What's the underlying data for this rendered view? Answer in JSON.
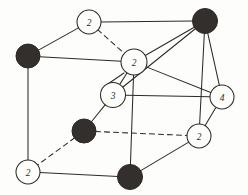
{
  "figure": {
    "width": 248,
    "height": 195,
    "background_color": "#fdfdfb",
    "line_color": "#2b2b28",
    "filled_atom_color": "#332f2d",
    "open_atom_fill": "#fdfdfb"
  },
  "atoms": [
    {
      "id": "a1",
      "label": "2",
      "type": "open",
      "cx": 89,
      "cy": 22,
      "r": 12,
      "name": "atom-top-back-left-2"
    },
    {
      "id": "a2",
      "label": "",
      "type": "filled",
      "cx": 205,
      "cy": 21,
      "r": 12.5,
      "name": "atom-top-back-right-filled"
    },
    {
      "id": "a3",
      "label": "",
      "type": "filled",
      "cx": 28,
      "cy": 56,
      "r": 12,
      "name": "atom-top-front-left-filled"
    },
    {
      "id": "a4",
      "label": "2",
      "type": "open",
      "cx": 134,
      "cy": 62,
      "r": 13,
      "name": "atom-center-2"
    },
    {
      "id": "a5",
      "label": "3",
      "type": "open",
      "cx": 113,
      "cy": 95,
      "r": 12.5,
      "name": "atom-center-lower-3"
    },
    {
      "id": "a6",
      "label": "4",
      "type": "open",
      "cx": 222,
      "cy": 97,
      "r": 12,
      "name": "atom-right-4"
    },
    {
      "id": "a7",
      "label": "",
      "type": "filled",
      "cx": 84,
      "cy": 131,
      "r": 12,
      "name": "atom-bottom-back-left-filled"
    },
    {
      "id": "a8",
      "label": "2",
      "type": "open",
      "cx": 199,
      "cy": 136,
      "r": 12,
      "name": "atom-bottom-back-right-2"
    },
    {
      "id": "a9",
      "label": "2",
      "type": "open",
      "cx": 28,
      "cy": 172,
      "r": 12,
      "name": "atom-bottom-front-left-2"
    },
    {
      "id": "a10",
      "label": "",
      "type": "filled",
      "cx": 130,
      "cy": 177,
      "r": 12.5,
      "name": "atom-bottom-front-right-filled"
    }
  ],
  "bonds": [
    {
      "from": "a1",
      "to": "a2",
      "style": "solid",
      "name": "bond-top-back-edge"
    },
    {
      "from": "a1",
      "to": "a3",
      "style": "solid",
      "name": "bond-top-left-edge"
    },
    {
      "from": "a1",
      "to": "a4",
      "style": "dashed",
      "name": "bond-top-vertical-hidden"
    },
    {
      "from": "a3",
      "to": "a4",
      "style": "solid",
      "name": "bond-upper-front-edge"
    },
    {
      "from": "a3",
      "to": "a9",
      "style": "solid",
      "name": "bond-left-vertical-edge"
    },
    {
      "from": "a2",
      "to": "a4",
      "style": "solid",
      "name": "bond-center-to-topright-a"
    },
    {
      "from": "a2",
      "to": "a5",
      "style": "solid",
      "name": "bond-center-lower-to-topright"
    },
    {
      "from": "a2",
      "to": "a6",
      "style": "solid",
      "name": "bond-right-vertical-edge"
    },
    {
      "from": "a2",
      "to": "a8",
      "style": "solid",
      "name": "bond-topright-to-bottomright"
    },
    {
      "from": "a4",
      "to": "a5",
      "style": "solid",
      "name": "bond-center-pair-left"
    },
    {
      "from": "a4",
      "to": "a6",
      "style": "solid",
      "name": "bond-center-to-right4"
    },
    {
      "from": "a4",
      "to": "a10",
      "style": "solid",
      "name": "bond-center-vertical-down"
    },
    {
      "from": "a5",
      "to": "a6",
      "style": "solid",
      "name": "bond-lower-center-horizontal"
    },
    {
      "from": "a5",
      "to": "a7",
      "style": "solid",
      "name": "bond-lower-center-vertical"
    },
    {
      "from": "a7",
      "to": "a8",
      "style": "dashed",
      "name": "bond-bottom-back-edge"
    },
    {
      "from": "a7",
      "to": "a9",
      "style": "dashed",
      "name": "bond-bottom-left-hidden"
    },
    {
      "from": "a9",
      "to": "a10",
      "style": "solid",
      "name": "bond-bottom-front-edge"
    },
    {
      "from": "a10",
      "to": "a8",
      "style": "solid",
      "name": "bond-bottom-right-edge"
    },
    {
      "from": "a6",
      "to": "a8",
      "style": "solid",
      "name": "bond-right4-to-bottomright"
    }
  ],
  "extra_bonds": [
    {
      "x1": 124,
      "y1": 73,
      "x2": 105,
      "y2": 86,
      "style": "solid",
      "name": "bond-center-pair-right"
    }
  ],
  "chart_data": {
    "type": "diagram",
    "open_atom_labels": [
      "2",
      "2",
      "3",
      "4",
      "2",
      "2"
    ],
    "filled_atom_count": 4,
    "open_atom_count": 6,
    "total_atom_count": 10,
    "bond_count": 20
  }
}
